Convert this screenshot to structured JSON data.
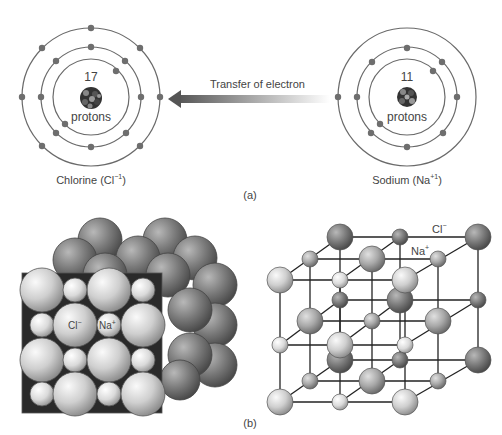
{
  "part_a": {
    "caption": "(a)",
    "chlorine": {
      "proton_count": "17",
      "protons_label": "protons",
      "name": "Chlorine (Cl",
      "charge": "−1",
      "close": ")",
      "shells": [
        2,
        8,
        7
      ]
    },
    "sodium": {
      "proton_count": "11",
      "protons_label": "protons",
      "name": "Sodium (Na",
      "charge": "+1",
      "close": ")",
      "shells": [
        2,
        8,
        1
      ]
    },
    "arrow_label": "Transfer of electron"
  },
  "part_b": {
    "caption": "(b)",
    "packing_model": {
      "cl_label": "Cl",
      "cl_charge": "−",
      "na_label": "Na",
      "na_charge": "+"
    },
    "lattice_model": {
      "cl_label": "Cl",
      "cl_charge": "−",
      "na_label": "Na",
      "na_charge": "+"
    }
  },
  "colors": {
    "shell": "#6a6a6a",
    "electron": "#6e6e6e",
    "cl_light": "#d2d2d2",
    "cl_dark": "#7c7c7c",
    "na_light": "#e6e6e6",
    "lattice_line": "#222222"
  }
}
